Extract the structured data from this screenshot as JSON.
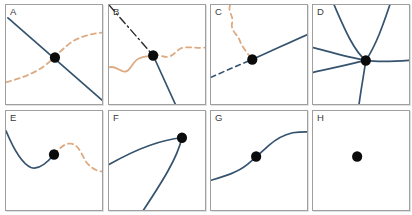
{
  "figure": {
    "colors": {
      "curve_blue": "#35536e",
      "curve_orange": "#ddab83",
      "dark_dashdot": "#2b2b2b",
      "dot": "#0b0b0b",
      "panel_border": "#9f9f9f",
      "label": "#3a3a3a"
    },
    "panels": [
      {
        "label": "A",
        "dot": {
          "x": 51,
          "y": 53,
          "r": 5.3
        },
        "curves": [
          {
            "name": "descending-straight-line-blue",
            "style": "solid",
            "color_key": "curve_blue",
            "width": 1.7,
            "path": "M 2,13 L 100,96"
          },
          {
            "name": "rising-s-curve-orange-dashed",
            "style": "dashed",
            "color_key": "curve_orange",
            "width": 1.8,
            "path": "M 0,78 C 16,74 30,69 42,60 C 52,52 56,47 66,39 C 76,32 88,29 100,28"
          }
        ]
      },
      {
        "label": "B",
        "dot": {
          "x": 46,
          "y": 51,
          "r": 5.3
        },
        "curves": [
          {
            "name": "dashdot-line-dark",
            "style": "dashdot",
            "color_key": "dark_dashdot",
            "width": 1.4,
            "path": "M 0,0 L 46,51"
          },
          {
            "name": "solid-line-blue-down",
            "style": "solid",
            "color_key": "curve_blue",
            "width": 1.7,
            "path": "M 46,51 L 69,100"
          },
          {
            "name": "wavy-solid-orange-left",
            "style": "solid",
            "color_key": "curve_orange",
            "width": 1.8,
            "path": "M 0,63 C 6,61 10,66 15,67 C 22,69 24,57 31,54 C 38,51 42,52 46,51"
          },
          {
            "name": "wavy-dashed-orange-right",
            "style": "dashed",
            "color_key": "curve_orange",
            "width": 1.8,
            "path": "M 46,51 C 53,49 57,54 63,52 C 69,50 71,44 78,43 C 85,42 92,44 100,43"
          }
        ]
      },
      {
        "label": "C",
        "dot": {
          "x": 43,
          "y": 55,
          "r": 5.3
        },
        "curves": [
          {
            "name": "wavy-dashed-orange-from-top",
            "style": "dashed",
            "color_key": "curve_orange",
            "width": 1.8,
            "path": "M 20,0 C 17,7 24,11 22,18 C 20,26 28,30 30,36 C 32,42 39,50 43,55"
          },
          {
            "name": "dashed-line-blue-lower-left",
            "style": "dashed",
            "color_key": "curve_blue",
            "width": 1.6,
            "path": "M 0,73 C 14,67 28,61 43,55"
          },
          {
            "name": "solid-line-blue-upper-right",
            "style": "solid",
            "color_key": "curve_blue",
            "width": 1.7,
            "path": "M 43,55 C 62,47 81,38 100,30"
          }
        ]
      },
      {
        "label": "D",
        "dot": {
          "x": 55,
          "y": 56,
          "r": 5.3
        },
        "curves": [
          {
            "name": "curve-topleft-to-right-blue",
            "style": "solid",
            "color_key": "curve_blue",
            "width": 1.7,
            "path": "M 22,0 C 32,22 42,46 55,56 C 70,58 85,57 100,56"
          },
          {
            "name": "curve-topright-to-left-blue",
            "style": "solid",
            "color_key": "curve_blue",
            "width": 1.7,
            "path": "M 80,0 C 73,20 66,40 55,56 C 37,53 16,47 0,43"
          },
          {
            "name": "curve-left-to-bottom-blue",
            "style": "solid",
            "color_key": "curve_blue",
            "width": 1.7,
            "path": "M 0,68 C 18,64 38,60 55,56 C 53,70 50,85 48,100"
          }
        ]
      },
      {
        "label": "E",
        "dot": {
          "x": 50,
          "y": 44,
          "r": 5.3
        },
        "curves": [
          {
            "name": "valley-curve-blue",
            "style": "solid",
            "color_key": "curve_blue",
            "width": 1.7,
            "path": "M 0,20 C 6,34 16,53 26,57 C 34,60 44,51 50,44"
          },
          {
            "name": "hump-curve-orange-dashed",
            "style": "dashed",
            "color_key": "curve_orange",
            "width": 1.8,
            "path": "M 50,44 C 56,37 62,32 68,33 C 76,34 79,45 84,52 C 88,57 94,61 100,61"
          }
        ]
      },
      {
        "label": "F",
        "dot": {
          "x": 76,
          "y": 27,
          "r": 5.3
        },
        "curves": [
          {
            "name": "cusp-curve-blue",
            "style": "solid",
            "color_key": "curve_blue",
            "width": 1.7,
            "path": "M 0,54 C 22,42 52,29 76,27 C 71,48 55,72 36,100"
          }
        ]
      },
      {
        "label": "G",
        "dot": {
          "x": 47,
          "y": 46,
          "r": 5.3
        },
        "curves": [
          {
            "name": "sigmoid-curve-blue",
            "style": "solid",
            "color_key": "curve_blue",
            "width": 1.7,
            "path": "M 0,70 C 14,66 28,62 38,54 C 48,46 52,42 60,35 C 68,28 76,24 85,22 C 91,21 96,21 100,21"
          }
        ]
      },
      {
        "label": "H",
        "dot": {
          "x": 46,
          "y": 46,
          "r": 5.3
        },
        "curves": []
      }
    ]
  }
}
